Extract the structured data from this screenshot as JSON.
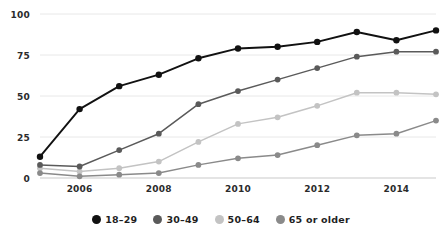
{
  "chart_data": {
    "type": "line",
    "title": "",
    "xlabel": "",
    "ylabel": "",
    "x": [
      2005,
      2006,
      2007,
      2008,
      2009,
      2010,
      2011,
      2012,
      2013,
      2014,
      2015
    ],
    "xtick_labels": [
      "2006",
      "2008",
      "2010",
      "2012",
      "2014"
    ],
    "xticks": [
      2006,
      2008,
      2010,
      2012,
      2014
    ],
    "ytick_labels": [
      "0",
      "25",
      "50",
      "75",
      "100"
    ],
    "yticks": [
      0,
      25,
      50,
      75,
      100
    ],
    "ylim": [
      0,
      100
    ],
    "xlim": [
      2005,
      2015
    ],
    "grid": true,
    "legend_position": "bottom",
    "series": [
      {
        "name": "18–29",
        "color": "#111111",
        "values": [
          13,
          42,
          56,
          63,
          73,
          79,
          80,
          83,
          89,
          84,
          90
        ]
      },
      {
        "name": "30–49",
        "color": "#5a5a5a",
        "values": [
          8,
          7,
          17,
          27,
          45,
          53,
          60,
          67,
          74,
          77,
          77
        ]
      },
      {
        "name": "50–64",
        "color": "#c3c3c3",
        "values": [
          6,
          4,
          6,
          10,
          22,
          33,
          37,
          44,
          52,
          52,
          51
        ]
      },
      {
        "name": "65 or older",
        "color": "#8a8a8a",
        "values": [
          3,
          1,
          2,
          3,
          8,
          12,
          14,
          20,
          26,
          27,
          35
        ]
      }
    ]
  },
  "legend": {
    "items": [
      {
        "label": "18–29",
        "color": "#111111"
      },
      {
        "label": "30–49",
        "color": "#5a5a5a"
      },
      {
        "label": "50–64",
        "color": "#c3c3c3"
      },
      {
        "label": "65 or older",
        "color": "#8a8a8a"
      }
    ]
  },
  "axes": {
    "y_labels": [
      "100",
      "75",
      "50",
      "25",
      "0"
    ],
    "x_labels": [
      "2006",
      "2008",
      "2010",
      "2012",
      "2014"
    ]
  }
}
